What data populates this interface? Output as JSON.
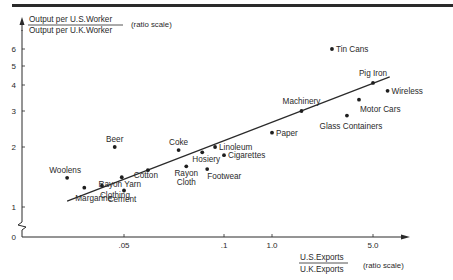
{
  "chart_data": {
    "type": "scatter",
    "title": "",
    "ylabel": {
      "numerator": "Output per U.S.Worker",
      "denominator": "Output per U.K.Worker",
      "note": "(ratio scale)"
    },
    "xlabel": {
      "numerator": "U.S.Exports",
      "denominator": "U.K.Exports",
      "note": "(ratio scale)"
    },
    "y_scale": "log",
    "x_scale": "log",
    "y_ticks": [
      {
        "value": 0,
        "label": "0"
      },
      {
        "value": 1,
        "label": "1"
      },
      {
        "value": 2,
        "label": "2"
      },
      {
        "value": 3,
        "label": "3"
      },
      {
        "value": 4,
        "label": "4"
      },
      {
        "value": 5,
        "label": "5"
      },
      {
        "value": 6,
        "label": "6"
      }
    ],
    "x_ticks": [
      {
        "value": 0.05,
        "label": ".05"
      },
      {
        "value": 0.1,
        "label": ".1"
      },
      {
        "value": 1.0,
        "label": "1.0"
      },
      {
        "value": 5.0,
        "label": "5.0"
      }
    ],
    "axis_break": "y between 0 and 1",
    "points": [
      {
        "name": "Woolens",
        "x": 0.03,
        "y": 1.4,
        "label_pos": "above"
      },
      {
        "name": "Margarine",
        "x": 0.035,
        "y": 1.25,
        "label_pos": "below-right"
      },
      {
        "name": "Clothing",
        "x": 0.041,
        "y": 1.28,
        "label_pos": "below-right"
      },
      {
        "name": "Beer",
        "x": 0.046,
        "y": 2.0,
        "label_pos": "above"
      },
      {
        "name": "Rayon Yarn",
        "x": 0.049,
        "y": 1.41,
        "label_pos": "below"
      },
      {
        "name": "Cement",
        "x": 0.05,
        "y": 1.21,
        "label_pos": "below"
      },
      {
        "name": "Cotton",
        "x": 0.059,
        "y": 1.53,
        "label_pos": "below"
      },
      {
        "name": "Coke",
        "x": 0.073,
        "y": 1.93,
        "label_pos": "above"
      },
      {
        "name": "Rayon Cloth",
        "x": 0.077,
        "y": 1.6,
        "label_pos": "below"
      },
      {
        "name": "Hosiery",
        "x": 0.086,
        "y": 1.88,
        "label_pos": "below"
      },
      {
        "name": "Footwear",
        "x": 0.089,
        "y": 1.55,
        "label_pos": "below-right"
      },
      {
        "name": "Linoleum",
        "x": 0.094,
        "y": 2.0,
        "label_pos": "right"
      },
      {
        "name": "Cigarettes",
        "x": 0.1,
        "y": 1.82,
        "label_pos": "right"
      },
      {
        "name": "Paper",
        "x": 1.0,
        "y": 2.35,
        "label_pos": "right"
      },
      {
        "name": "Machinery",
        "x": 1.6,
        "y": 3.0,
        "label_pos": "above"
      },
      {
        "name": "Tin Cans",
        "x": 2.6,
        "y": 6.0,
        "label_pos": "right"
      },
      {
        "name": "Glass Containers",
        "x": 3.3,
        "y": 2.85,
        "label_pos": "below"
      },
      {
        "name": "Motor Cars",
        "x": 4.0,
        "y": 3.4,
        "label_pos": "below-right"
      },
      {
        "name": "Pig Iron",
        "x": 5.0,
        "y": 4.1,
        "label_pos": "above"
      },
      {
        "name": "Wireless",
        "x": 6.2,
        "y": 3.75,
        "label_pos": "right"
      }
    ],
    "trend_line": {
      "from": {
        "x": 0.03,
        "y": 1.07
      },
      "to": {
        "x": 6.4,
        "y": 4.4
      }
    },
    "grid": false,
    "legend": "none"
  }
}
